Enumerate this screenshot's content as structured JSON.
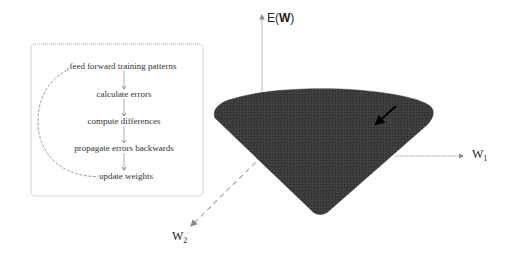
{
  "flowchart": {
    "steps": [
      "feed forward training patterns",
      "calculate errors",
      "compute differences",
      "propagate errors backwards",
      "update weights"
    ],
    "loop": "update weights back to feed forward training patterns"
  },
  "surface": {
    "axes": {
      "vertical": {
        "prefix": "E(",
        "bold": "W",
        "suffix": ")"
      },
      "w1": {
        "base": "W",
        "sub": "1"
      },
      "w2": {
        "base": "W",
        "sub": "2"
      }
    },
    "shape": "inverted cone error surface",
    "gradient_arrow": "descent direction"
  },
  "colors": {
    "cone_fill": "#3a3a3a",
    "axis": "#9a9a9a",
    "box_border": "#a0a0a0",
    "text": "#333333"
  }
}
